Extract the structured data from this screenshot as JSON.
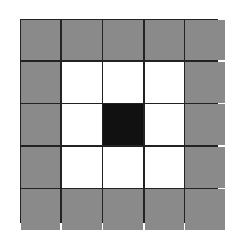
{
  "diagram": {
    "type": "grid",
    "rows": 5,
    "cols": 5,
    "legend": {
      "gray": "#8a8a8a",
      "white": "#ffffff",
      "black": "#111111"
    },
    "cells": [
      [
        "gray",
        "gray",
        "gray",
        "gray",
        "gray"
      ],
      [
        "gray",
        "white",
        "white",
        "white",
        "gray"
      ],
      [
        "gray",
        "white",
        "black",
        "white",
        "gray"
      ],
      [
        "gray",
        "white",
        "white",
        "white",
        "gray"
      ],
      [
        "gray",
        "gray",
        "gray",
        "gray",
        "gray"
      ]
    ]
  }
}
